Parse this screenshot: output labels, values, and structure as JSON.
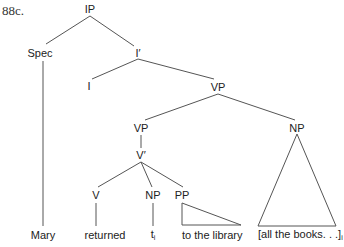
{
  "example": {
    "number": "88c."
  },
  "tree": {
    "nodes": {
      "IP": "IP",
      "Spec": "Spec",
      "I_bar": "I′",
      "I": "I",
      "VP_upper": "VP",
      "VP_lower": "VP",
      "NP_adjoined": "NP",
      "V_bar": "V′",
      "V": "V",
      "NP_trace": "NP",
      "PP": "PP"
    },
    "leaves": {
      "mary": "Mary",
      "returned": "returned",
      "trace": "t",
      "trace_index": "i",
      "to_the_library": "to the library",
      "all_the_books": "[all the books. . .]",
      "all_the_books_index": "i"
    }
  },
  "colors": {
    "line": "#555555",
    "text": "#222222"
  }
}
